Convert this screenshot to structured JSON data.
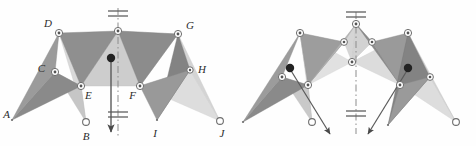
{
  "figure": {
    "name": "two-pose-linkage-diagram",
    "background_color": "#fefefe",
    "width": 476,
    "height": 146,
    "panels": [
      {
        "id": "left-panel",
        "name": "first-configuration",
        "labels": [
          {
            "text": "A",
            "x": 10,
            "y": 118,
            "name": "joint-label-a"
          },
          {
            "text": "B",
            "x": 86,
            "y": 133,
            "name": "joint-label-b"
          },
          {
            "text": "C",
            "x": 42,
            "y": 71,
            "name": "joint-label-c"
          },
          {
            "text": "D",
            "x": 47,
            "y": 32,
            "name": "joint-label-d"
          },
          {
            "text": "E",
            "x": 91,
            "y": 91,
            "name": "joint-label-e"
          },
          {
            "text": "F",
            "x": 145,
            "y": 93,
            "name": "joint-label-f"
          },
          {
            "text": "G",
            "x": 185,
            "y": 33,
            "name": "joint-label-g"
          },
          {
            "text": "H",
            "x": 196,
            "y": 72,
            "name": "joint-label-h"
          },
          {
            "text": "I",
            "x": 155,
            "y": 128,
            "name": "joint-label-i"
          },
          {
            "text": "J",
            "x": 225,
            "y": 128,
            "name": "joint-label-j"
          }
        ]
      },
      {
        "id": "right-panel",
        "name": "second-configuration",
        "labels": []
      }
    ],
    "colors": {
      "dark_gray_link": "#7e7e7e",
      "mid_gray_link": "#a6a6a6",
      "light_gray_link": "#cfcfcf",
      "pale_gray_link": "#dcdcdc",
      "outline": "#9a9a9a",
      "axis_line": "#8c8c8c",
      "arrow": "#5a5a5a",
      "marker_fill": "#ffffff",
      "marker_stroke": "#6e6e6e",
      "solid_dot": "#222222",
      "label_text": "#2b2b2b"
    },
    "annotations": {
      "symmetry_axis_style": "dash-dot vertical centerline",
      "ground_symbol": "double-hatch ground/fixed support marker",
      "arrow_left": "downward velocity arrow along axis",
      "arrow_right_a": "oblique arrow pointing down-right",
      "arrow_right_b": "oblique arrow pointing down-left"
    }
  }
}
